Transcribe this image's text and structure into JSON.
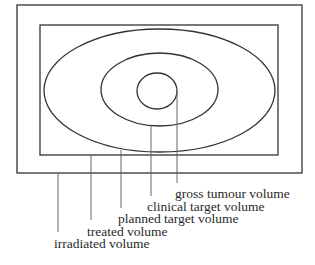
{
  "diagram": {
    "colors": {
      "background": "#ffffff",
      "shape_stroke": "#333333",
      "leader_stroke": "#666666",
      "text": "#2a2a2a"
    },
    "regions": [
      {
        "id": "irradiated",
        "shape": "rect",
        "x": 17,
        "y": 5,
        "width": 285,
        "height": 168
      },
      {
        "id": "treated",
        "shape": "rect",
        "x": 40,
        "y": 25,
        "width": 238,
        "height": 130
      },
      {
        "id": "planned",
        "shape": "ellipse",
        "cx": 159.5,
        "cy": 90.5,
        "rx": 115.5,
        "ry": 61.5
      },
      {
        "id": "clinical",
        "shape": "ellipse",
        "cx": 159.5,
        "cy": 89.5,
        "rx": 58.5,
        "ry": 36.5
      },
      {
        "id": "gross",
        "shape": "ellipse",
        "cx": 157,
        "cy": 91,
        "rx": 20,
        "ry": 18
      }
    ],
    "labels": [
      {
        "id": "gross",
        "text": "gross tumour volume",
        "line_x": 177,
        "line_y1": 91,
        "line_y2": 183,
        "text_x": 175,
        "text_y": 198
      },
      {
        "id": "clinical",
        "text": "clinical target volume",
        "line_x": 151,
        "line_y1": 126,
        "line_y2": 196,
        "text_x": 147,
        "text_y": 211
      },
      {
        "id": "planned",
        "text": "planned target volume",
        "line_x": 121,
        "line_y1": 150,
        "line_y2": 208,
        "text_x": 118,
        "text_y": 223
      },
      {
        "id": "treated",
        "text": "treated volume",
        "line_x": 91,
        "line_y1": 155,
        "line_y2": 220,
        "text_x": 87,
        "text_y": 236
      },
      {
        "id": "irradiated",
        "text": "irradiated volume",
        "line_x": 58,
        "line_y1": 173,
        "line_y2": 232,
        "text_x": 54,
        "text_y": 248
      }
    ]
  }
}
